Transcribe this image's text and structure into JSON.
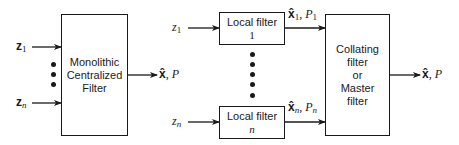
{
  "centralized": {
    "box_label_lines": [
      "Monolithic",
      "Centralized",
      "Filter"
    ],
    "inputs": [
      {
        "symbol": "z",
        "subscript": "1"
      },
      {
        "symbol": "z",
        "subscript": "n"
      }
    ],
    "output": {
      "estimate": "x̂",
      "separator": ", ",
      "covariance": "P"
    }
  },
  "decentralized": {
    "local_filters": [
      {
        "label": "Local filter",
        "index": "1",
        "input": {
          "symbol": "z",
          "subscript": "1"
        },
        "output": {
          "estimate": "x̂",
          "est_sub": "1",
          "separator": ", ",
          "covariance": "P",
          "cov_sub": "1"
        }
      },
      {
        "label": "Local filter",
        "index": "n",
        "input": {
          "symbol": "z",
          "subscript": "n"
        },
        "output": {
          "estimate": "x̂",
          "est_sub": "n",
          "separator": ", ",
          "covariance": "P",
          "cov_sub": "n"
        }
      }
    ],
    "master": {
      "box_label_lines": [
        "Collating",
        "filter",
        "or",
        "Master",
        "filter"
      ],
      "output": {
        "estimate": "x̂",
        "separator": ", ",
        "covariance": "P"
      }
    }
  }
}
